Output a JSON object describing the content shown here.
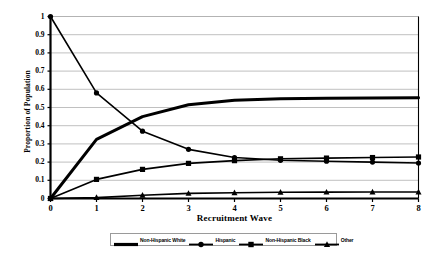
{
  "chart_data": {
    "type": "line",
    "title": "",
    "xlabel": "Recruitment Wave",
    "ylabel": "Proportion of Population",
    "x": [
      0,
      1,
      2,
      3,
      4,
      5,
      6,
      7,
      8
    ],
    "xlim": [
      0,
      8
    ],
    "ylim": [
      0,
      1
    ],
    "xticks": [
      "0",
      "1",
      "2",
      "3",
      "4",
      "5",
      "6",
      "7",
      "8"
    ],
    "yticks": [
      "0",
      "0.1",
      "0.2",
      "0.3",
      "0.4",
      "0.5",
      "0.6",
      "0.7",
      "0.8",
      "0.9",
      "1"
    ],
    "grid": "horizontal",
    "legend_position": "bottom",
    "series": [
      {
        "name": "Non-Hispanic White",
        "marker": "none",
        "line_weight": "thick",
        "values": [
          0.0,
          0.325,
          0.45,
          0.515,
          0.54,
          0.548,
          0.551,
          0.552,
          0.553
        ]
      },
      {
        "name": "Hispanic",
        "marker": "circle",
        "line_weight": "medium",
        "values": [
          1.0,
          0.58,
          0.37,
          0.27,
          0.225,
          0.21,
          0.205,
          0.2,
          0.195
        ]
      },
      {
        "name": "Non-Hispanic Black",
        "marker": "square",
        "line_weight": "medium",
        "values": [
          0.0,
          0.105,
          0.16,
          0.193,
          0.208,
          0.218,
          0.222,
          0.225,
          0.228
        ]
      },
      {
        "name": "Other",
        "marker": "triangle",
        "line_weight": "medium",
        "values": [
          0.0,
          0.005,
          0.018,
          0.028,
          0.032,
          0.034,
          0.035,
          0.036,
          0.036
        ]
      }
    ]
  },
  "colors": {
    "line": "#000000",
    "grid": "#b0b0b0",
    "axis": "#000000",
    "background": "#ffffff",
    "legend_border": "#9a9a9a"
  }
}
